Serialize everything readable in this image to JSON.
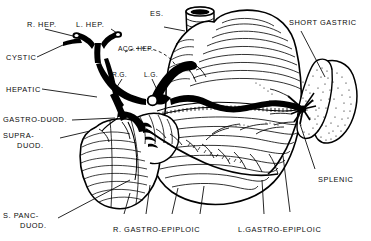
{
  "figure": {
    "type": "anatomical-line-illustration",
    "width": 371,
    "height": 241,
    "ink_color": "#000000",
    "background_color": "#ffffff"
  },
  "labels": {
    "r_hep": "R. HEP.",
    "l_hep": "L. HEP.",
    "es": "ES.",
    "short_gastric": "SHORT GASTRIC",
    "cystic": "CYSTIC",
    "acc_hep": "ACC. HEP.",
    "hepatic": "HEPATIC",
    "rg": "R.G.",
    "lg": "L.G.",
    "gastro_duod": "GASTRO-DUOD.",
    "supra_duod_1": "SUPRA-",
    "supra_duod_2": "DUOD.",
    "splenic": "SPLENIC",
    "s_panc_duod_1": "S. PANC-",
    "s_panc_duod_2": "DUOD.",
    "r_gastro_epiploic": "R. GASTRO-EPIPLOIC",
    "l_gastro_epiploic": "L.GASTRO-EPIPLOIC"
  },
  "structures": [
    {
      "name": "esophagus",
      "label_key": "es"
    },
    {
      "name": "stomach",
      "label_key": null
    },
    {
      "name": "duodenum",
      "label_key": null
    },
    {
      "name": "spleen",
      "label_key": null
    },
    {
      "name": "celiac-trunk",
      "label_key": null
    },
    {
      "name": "right-hepatic-artery",
      "label_key": "r_hep"
    },
    {
      "name": "left-hepatic-artery",
      "label_key": "l_hep"
    },
    {
      "name": "cystic-artery",
      "label_key": "cystic"
    },
    {
      "name": "accessory-hepatic-artery",
      "label_key": "acc_hep"
    },
    {
      "name": "common-hepatic-artery",
      "label_key": "hepatic"
    },
    {
      "name": "right-gastric-artery",
      "label_key": "rg"
    },
    {
      "name": "left-gastric-artery",
      "label_key": "lg"
    },
    {
      "name": "gastroduodenal-artery",
      "label_key": "gastro_duod"
    },
    {
      "name": "supraduodenal-artery",
      "label_key": "supra_duod_1"
    },
    {
      "name": "superior-pancreaticoduodenal-artery",
      "label_key": "s_panc_duod_1"
    },
    {
      "name": "right-gastroepiploic-artery",
      "label_key": "r_gastro_epiploic"
    },
    {
      "name": "left-gastroepiploic-artery",
      "label_key": "l_gastro_epiploic"
    },
    {
      "name": "splenic-artery",
      "label_key": "splenic"
    },
    {
      "name": "short-gastric-arteries",
      "label_key": "short_gastric"
    }
  ]
}
